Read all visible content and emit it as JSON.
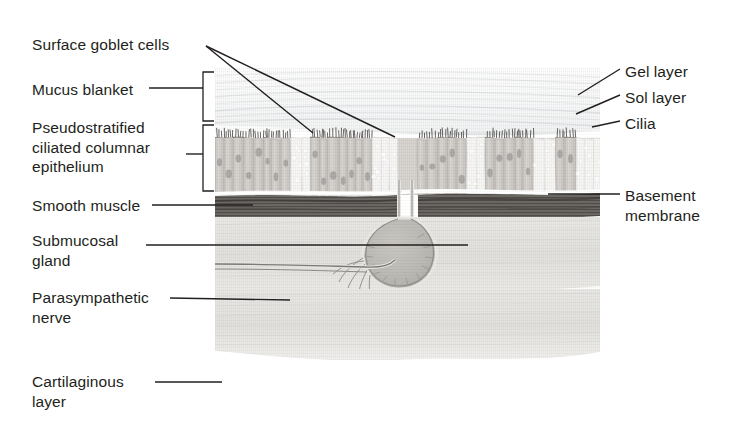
{
  "figure": {
    "background": "#ffffff",
    "ink": "#231f20"
  },
  "labels_left": [
    {
      "id": "surface-goblet-cells",
      "text": "Surface goblet cells",
      "x": 32,
      "y": 35
    },
    {
      "id": "mucus-blanket",
      "text": "Mucus blanket",
      "x": 32,
      "y": 80
    },
    {
      "id": "pseudostratified",
      "text": "Pseudostratified\nciliated columnar\nepithelium",
      "x": 32,
      "y": 118
    },
    {
      "id": "smooth-muscle",
      "text": "Smooth muscle",
      "x": 32,
      "y": 196
    },
    {
      "id": "submucosal-gland",
      "text": "Submucosal\ngland",
      "x": 32,
      "y": 231
    },
    {
      "id": "parasympathetic-nerve",
      "text": "Parasympathetic\nnerve",
      "x": 32,
      "y": 288
    },
    {
      "id": "cartilaginous-layer",
      "text": "Cartilaginous\nlayer",
      "x": 32,
      "y": 372
    }
  ],
  "labels_right": [
    {
      "id": "gel-layer",
      "text": "Gel layer",
      "x": 625,
      "y": 62
    },
    {
      "id": "sol-layer",
      "text": "Sol layer",
      "x": 625,
      "y": 88
    },
    {
      "id": "cilia",
      "text": "Cilia",
      "x": 625,
      "y": 114
    },
    {
      "id": "basement-membrane",
      "text": "Basement\nmembrane",
      "x": 625,
      "y": 186
    }
  ],
  "leaders": [
    {
      "id": "goblet-leader-a",
      "points": "206,46 313,133"
    },
    {
      "id": "goblet-leader-b",
      "points": "206,46 395,137"
    },
    {
      "id": "mucus-leader",
      "points": "149,88 203,88"
    },
    {
      "id": "epithelium-leader",
      "points": "186,154 203,154"
    },
    {
      "id": "smooth-leader",
      "points": "152,205 253,205"
    },
    {
      "id": "gland-leader",
      "points": "146,245 468,245"
    },
    {
      "id": "nerve-leader",
      "points": "170,298 290,300"
    },
    {
      "id": "cartilage-leader",
      "points": "155,382 222,382"
    },
    {
      "id": "gel-leader",
      "points": "620,69 578,95"
    },
    {
      "id": "sol-leader",
      "points": "620,95 576,114"
    },
    {
      "id": "cilia-leader",
      "points": "620,121 592,127"
    },
    {
      "id": "basement-leader",
      "points": "620,194 548,194"
    }
  ],
  "brackets": [
    {
      "id": "mucus-blanket-bracket",
      "x": 203,
      "y1": 72,
      "y2": 121,
      "tip": 214
    },
    {
      "id": "epithelium-bracket",
      "x": 203,
      "y1": 125,
      "y2": 191,
      "tip": 214
    }
  ],
  "art_layers": [
    {
      "id": "gel-layer-band",
      "name": "Gel layer",
      "color": "#eceff0"
    },
    {
      "id": "sol-layer-band",
      "name": "Sol layer",
      "color": "#e3e7e8"
    },
    {
      "id": "cilia-band",
      "name": "Cilia",
      "color": "#4d4d4d"
    },
    {
      "id": "columnar-epithelium",
      "name": "Ciliated columnar cells",
      "color": "#a9a39c"
    },
    {
      "id": "goblet-cells",
      "name": "Goblet cells",
      "color": "#efeeea"
    },
    {
      "id": "basement-membrane-line",
      "name": "Basement membrane",
      "color": "#fbfbfb"
    },
    {
      "id": "smooth-muscle-band",
      "name": "Smooth muscle",
      "color": "#6e6a66"
    },
    {
      "id": "submucosa",
      "name": "Submucosa",
      "color": "#cfcdc8"
    },
    {
      "id": "submucosal-gland-body",
      "name": "Submucosal gland",
      "color": "#bcbab5"
    },
    {
      "id": "parasympathetic-nerve-fiber",
      "name": "Parasympathetic nerve",
      "color": "#8c8984"
    },
    {
      "id": "cartilaginous-layer-band",
      "name": "Cartilaginous layer",
      "color": "#d6d4cf"
    }
  ]
}
